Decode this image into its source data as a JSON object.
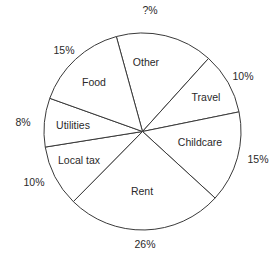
{
  "chart_data": {
    "type": "pie",
    "title": "",
    "center": [
      142.5,
      131.5
    ],
    "radius": 98.5,
    "start_angle_deg": 344.6,
    "direction": "clockwise",
    "slices": [
      {
        "label": "Other",
        "value": 16,
        "display_pct": "?%",
        "start": 344.6,
        "end": 402.1,
        "label_pos": [
          146,
          63
        ],
        "pct_pos": [
          150,
          11
        ]
      },
      {
        "label": "Travel",
        "value": 10,
        "display_pct": "10%",
        "start": 42.1,
        "end": 78.5,
        "label_pos": [
          206,
          98
        ],
        "pct_pos": [
          243,
          77
        ]
      },
      {
        "label": "Childcare",
        "value": 15,
        "display_pct": "15%",
        "start": 78.5,
        "end": 132.5,
        "label_pos": [
          200,
          143
        ],
        "pct_pos": [
          258,
          160
        ]
      },
      {
        "label": "Rent",
        "value": 26,
        "display_pct": "26%",
        "start": 132.5,
        "end": 224.6,
        "label_pos": [
          142,
          192
        ],
        "pct_pos": [
          145,
          245
        ]
      },
      {
        "label": "Local tax",
        "value": 10,
        "display_pct": "10%",
        "start": 224.6,
        "end": 260.9,
        "label_pos": [
          79,
          161
        ],
        "pct_pos": [
          34,
          183
        ]
      },
      {
        "label": "Utilities",
        "value": 8,
        "display_pct": "8%",
        "start": 260.9,
        "end": 289.7,
        "label_pos": [
          73,
          126
        ],
        "pct_pos": [
          23,
          123
        ]
      },
      {
        "label": "Food",
        "value": 15,
        "display_pct": "15%",
        "start": 289.7,
        "end": 344.6,
        "label_pos": [
          94,
          83
        ],
        "pct_pos": [
          64,
          51
        ]
      }
    ],
    "labels": [
      "Other",
      "Travel",
      "Childcare",
      "Rent",
      "Local tax",
      "Utilities",
      "Food"
    ],
    "values": [
      null,
      10,
      15,
      26,
      10,
      8,
      15
    ],
    "value_labels": [
      "?%",
      "10%",
      "15%",
      "26%",
      "10%",
      "8%",
      "15%"
    ],
    "unit": "%",
    "legend": "none",
    "grid": false
  }
}
